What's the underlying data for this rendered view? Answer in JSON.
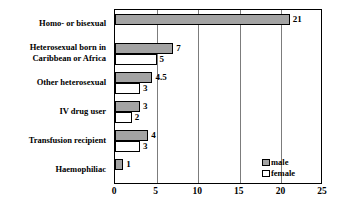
{
  "chart_data": {
    "type": "bar",
    "orientation": "horizontal",
    "title": "",
    "xlabel": "",
    "ylabel": "",
    "xlim": [
      0,
      25
    ],
    "xticks": [
      0,
      5,
      10,
      15,
      20,
      25
    ],
    "grid": true,
    "legend_position": "bottom-right",
    "categories": [
      "Homo- or bisexual",
      "Heterosexual born in Caribbean or Africa",
      "Other heterosexual",
      "IV drug user",
      "Transfusion recipient",
      "Haemophiliac"
    ],
    "category_lines": [
      [
        "Homo- or bisexual"
      ],
      [
        "Heterosexual born in",
        "Caribbean or Africa"
      ],
      [
        "Other heterosexual"
      ],
      [
        "IV drug user"
      ],
      [
        "Transfusion recipient"
      ],
      [
        "Haemophiliac"
      ]
    ],
    "series": [
      {
        "name": "male",
        "color": "#a3a3a3",
        "values": [
          21,
          7,
          4.5,
          3,
          4,
          1
        ],
        "labels": [
          "21",
          "7",
          "4.5",
          "3",
          "4",
          "1"
        ]
      },
      {
        "name": "female",
        "color": "#ffffff",
        "values": [
          0,
          5,
          3,
          2,
          3,
          0
        ],
        "labels": [
          "",
          "5",
          "3",
          "2",
          "3",
          ""
        ]
      }
    ]
  },
  "legend": {
    "items": [
      {
        "label": "male",
        "swatch": "male"
      },
      {
        "label": "female",
        "swatch": "female"
      }
    ]
  },
  "axis": {
    "tick_labels": [
      "0",
      "5",
      "10",
      "15",
      "20",
      "25"
    ]
  }
}
